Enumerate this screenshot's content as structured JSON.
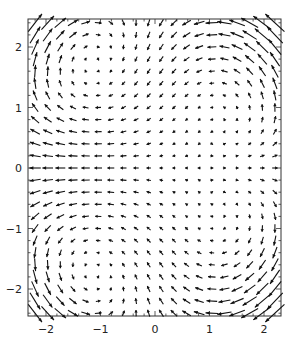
{
  "chart_data": {
    "type": "vector_field",
    "title": "",
    "xlabel": "",
    "ylabel": "",
    "xlim": [
      -2.3,
      2.3
    ],
    "ylim": [
      -2.5,
      2.5
    ],
    "grid": false,
    "x_ticks": [
      -2,
      -1,
      0,
      1,
      2
    ],
    "x_tick_labels": [
      "−2",
      "−1",
      "0",
      "1",
      "2"
    ],
    "y_ticks": [
      -2,
      -1,
      0,
      1,
      2
    ],
    "y_tick_labels": [
      "−2",
      "−1",
      "0",
      "1",
      "2"
    ],
    "sample_grid": {
      "x_start": -2.2,
      "x_end": 2.2,
      "nx": 20,
      "y_start": -2.4,
      "y_end": 2.4,
      "ny": 25
    },
    "field_description": "Four-vortex flow: leftward along y=0 for x<1, rightward for x>1; downward at top center, upward at bottom center; upward along outer sides for y>0, downward for y<0.",
    "field_model": {
      "u": "(x - 0.9) - 0.6*x*y^2",
      "v": "0.6*y*(x^2 - 1.2)"
    },
    "arrow_color": "#111111",
    "frame_color": "#333333"
  }
}
